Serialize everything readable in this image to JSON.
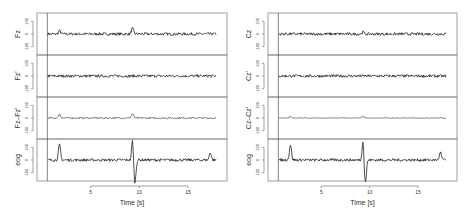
{
  "chart_data": [
    {
      "type": "line",
      "title": "",
      "xlabel": "Time [s]",
      "x_ticks": [
        5,
        10,
        15
      ],
      "xlim": [
        0,
        18.5
      ],
      "panels": [
        {
          "name": "Fz",
          "ylabel": "Fz",
          "y_ticks": [
            -100,
            0,
            100
          ],
          "ylim": [
            -150,
            150
          ],
          "events": [
            {
              "t": 1.8,
              "amp": 25
            },
            {
              "t": 9.3,
              "amp": 45
            }
          ]
        },
        {
          "name": "Fz'",
          "ylabel": "Fz'",
          "y_ticks": [
            -100,
            0,
            100
          ],
          "ylim": [
            -150,
            150
          ],
          "events": []
        },
        {
          "name": "Fz-Fz'",
          "ylabel": "Fz–Fz'",
          "y_ticks": [
            -100,
            0,
            100
          ],
          "ylim": [
            -150,
            150
          ],
          "events": [
            {
              "t": 1.8,
              "amp": 30
            },
            {
              "t": 9.3,
              "amp": 35
            }
          ]
        },
        {
          "name": "eog",
          "ylabel": "eog",
          "y_ticks": [
            -100,
            0,
            100
          ],
          "ylim": [
            -150,
            150
          ],
          "events": [
            {
              "t": 1.8,
              "amp": 120
            },
            {
              "t": 9.3,
              "amp": 160
            },
            {
              "t": 17.3,
              "amp": 60
            }
          ]
        }
      ]
    },
    {
      "type": "line",
      "title": "",
      "xlabel": "Time [s]",
      "x_ticks": [
        5,
        10,
        15
      ],
      "xlim": [
        0,
        18.5
      ],
      "panels": [
        {
          "name": "Cz",
          "ylabel": "Cz",
          "y_ticks": [
            -100,
            0,
            100
          ],
          "ylim": [
            -150,
            150
          ],
          "events": [
            {
              "t": 9.3,
              "amp": 15
            }
          ]
        },
        {
          "name": "Cz'",
          "ylabel": "Cz'",
          "y_ticks": [
            -100,
            0,
            100
          ],
          "ylim": [
            -150,
            150
          ],
          "events": []
        },
        {
          "name": "Cz-Cz'",
          "ylabel": "Cz–Cz'",
          "y_ticks": [
            -100,
            0,
            100
          ],
          "ylim": [
            -150,
            150
          ],
          "events": [
            {
              "t": 1.8,
              "amp": 12
            },
            {
              "t": 9.3,
              "amp": 15
            }
          ]
        },
        {
          "name": "eog",
          "ylabel": "eog",
          "y_ticks": [
            -100,
            0,
            100
          ],
          "ylim": [
            -150,
            150
          ],
          "events": [
            {
              "t": 1.8,
              "amp": 120
            },
            {
              "t": 9.3,
              "amp": 160
            },
            {
              "t": 17.3,
              "amp": 60
            }
          ]
        }
      ]
    }
  ],
  "labels": {
    "left": {
      "p0": "Fz",
      "p1": "Fz'",
      "p2": "Fz–Fz'",
      "p3": "eog",
      "xlabel": "Time [s]"
    },
    "right": {
      "p0": "Cz",
      "p1": "Cz'",
      "p2": "Cz–Cz'",
      "p3": "eog",
      "xlabel": "Time [s]"
    },
    "ytick_top": "100",
    "ytick_mid": "0",
    "ytick_bot": "-100",
    "xt5": "5",
    "xt10": "10",
    "xt15": "15"
  },
  "colors": {
    "trace": "#222222",
    "frame": "#888888",
    "marker_line": "#333333"
  }
}
